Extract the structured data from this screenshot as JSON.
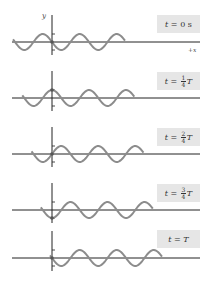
{
  "figure": {
    "axis_labels": {
      "y": "y",
      "x": "+x"
    },
    "panels": [
      {
        "label_prefix": "t = ",
        "label_value": "0 s",
        "phase_quarters": 0
      },
      {
        "label_prefix": "t = ",
        "frac_num": "1",
        "frac_den": "4",
        "label_suffix": "T",
        "phase_quarters": 1
      },
      {
        "label_prefix": "t = ",
        "frac_num": "2",
        "frac_den": "4",
        "label_suffix": "T",
        "phase_quarters": 2
      },
      {
        "label_prefix": "t = ",
        "frac_num": "3",
        "frac_den": "4",
        "label_suffix": "T",
        "phase_quarters": 3
      },
      {
        "label_prefix": "t = ",
        "label_value": "T",
        "phase_quarters": 4
      }
    ],
    "colors": {
      "wave": "#8c8c8c",
      "axis": "#222222",
      "label_bg": "#e6e6e6"
    }
  }
}
